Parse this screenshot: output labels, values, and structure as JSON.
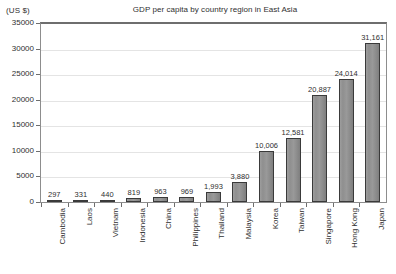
{
  "chart_data": {
    "type": "bar",
    "title": "GDP per capita by country region in East Asia",
    "unit_label": "(US $)",
    "xlabel": "",
    "ylabel": "",
    "ylim": [
      0,
      35000
    ],
    "ytick_step": 5000,
    "grid": true,
    "legend": "none",
    "orientation": "vertical",
    "categories": [
      "Cambodia",
      "Laos",
      "Vietnam",
      "Indonesia",
      "China",
      "Philippines",
      "Thailand",
      "Malaysia",
      "Korea",
      "Taiwan",
      "Singapore",
      "Hong Kong",
      "Japan"
    ],
    "values": [
      297,
      331,
      440,
      819,
      963,
      969,
      1993,
      3880,
      10006,
      12581,
      20887,
      24014,
      31161
    ],
    "value_labels": [
      "297",
      "331",
      "440",
      "819",
      "963",
      "969",
      "1,993",
      "3,880",
      "10,006",
      "12,581",
      "20,887",
      "24,014",
      "31,161"
    ],
    "ytick_labels": [
      "0",
      "5000",
      "10000",
      "15000",
      "20000",
      "25000",
      "30000",
      "35000"
    ],
    "ytick_values": [
      0,
      5000,
      10000,
      15000,
      20000,
      25000,
      30000,
      35000
    ],
    "colors": {
      "bar_fill": "#939393",
      "bar_border": "#3a3a3a",
      "gridline": "#e4e4e4",
      "axis": "#6e6e6e",
      "text": "#2f2f2f",
      "background": "#ffffff"
    }
  }
}
